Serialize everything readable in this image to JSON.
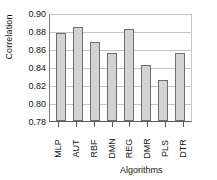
{
  "chart_data": {
    "type": "bar",
    "title": "",
    "xlabel": "Algorithms",
    "ylabel": "Correlation",
    "categories": [
      "MLP",
      "AUT",
      "RBF",
      "DMN",
      "REG",
      "DMR",
      "PLS",
      "DTR"
    ],
    "values": [
      0.878,
      0.884,
      0.868,
      0.856,
      0.882,
      0.842,
      0.826,
      0.856
    ],
    "series": [
      {
        "name": "Correlation",
        "values": [
          0.878,
          0.884,
          0.868,
          0.856,
          0.882,
          0.842,
          0.826,
          0.856
        ]
      }
    ],
    "ylim": [
      0.78,
      0.9
    ],
    "ytick_labels": [
      "0.90",
      "0.88",
      "0.86",
      "0.84",
      "0.82",
      "0.80",
      "0.78"
    ],
    "ytick_values": [
      0.9,
      0.88,
      0.86,
      0.84,
      0.82,
      0.8,
      0.78
    ],
    "ytick_step": 0.02,
    "grid": true,
    "grid_axis": "y",
    "legend": false,
    "legend_position": "none",
    "bar_fill_color": "#d3d3d3",
    "bar_edge_color": "#6e6e6e",
    "gridline_color": "#c4c4c4",
    "axis_color": "#5a5a5a",
    "background_color": "#ffffff"
  }
}
